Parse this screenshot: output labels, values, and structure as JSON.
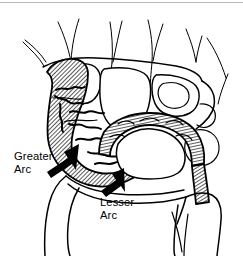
{
  "figure": {
    "kind": "anatomical-line-drawing",
    "background_color": "#ffffff",
    "ink_color": "#000000",
    "top_rule_color": "#b9b9b9",
    "width": 243,
    "height": 256
  },
  "annotations": [
    {
      "id": "greater-arc",
      "line1": "Greater",
      "line2": "Arc",
      "text_x": 14,
      "text_y": 160,
      "arrow": {
        "tail_x": 47,
        "tail_y": 171,
        "tip_x": 79,
        "tip_y": 144,
        "direction": "up-right"
      }
    },
    {
      "id": "lesser-arc",
      "line1": "Lesser",
      "line2": "Arc",
      "text_x": 100,
      "text_y": 202,
      "arrow": {
        "tail_x": 106,
        "tail_y": 193,
        "tip_x": 124,
        "tip_y": 168,
        "direction": "up-right-steep"
      }
    }
  ],
  "regions": {
    "greater_arc_label": "Greater Arc",
    "lesser_arc_label": "Lesser Arc",
    "hatch_fill_pattern": "diagonal-hatch",
    "hatch_angle_degrees": 45,
    "hatch_spacing_px": 2
  }
}
